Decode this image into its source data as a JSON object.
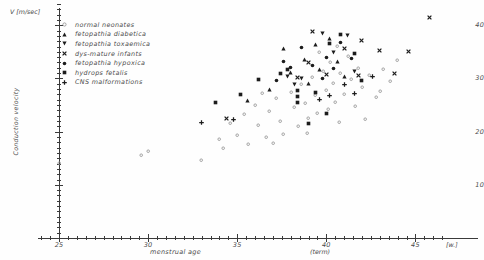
{
  "axes": {
    "y_unit": "V [m/sec]",
    "y_title": "Conduction velocity",
    "x_title": "menstrual age",
    "x_term_note": "(term)",
    "x_unit": "[w.]",
    "y_ticks": [
      "10",
      "20",
      "30",
      "40"
    ],
    "x_ticks": [
      "25",
      "30",
      "35",
      "40",
      "45"
    ]
  },
  "legend": {
    "items": [
      {
        "label": "normal neonates",
        "marker": "open-circle"
      },
      {
        "label": "fetopathia diabetica",
        "marker": "triangle-up"
      },
      {
        "label": "fetopathia toxaemica",
        "marker": "triangle-down"
      },
      {
        "label": "dys-mature infants",
        "marker": "cross-x"
      },
      {
        "label": "fetopathia hypoxica",
        "marker": "filled-circle"
      },
      {
        "label": "hydrops fetalis",
        "marker": "filled-square"
      },
      {
        "label": "CNS malformations",
        "marker": "plus"
      }
    ]
  },
  "chart_data": {
    "type": "scatter",
    "title": "",
    "xlabel": "menstrual age",
    "ylabel": "Conduction velocity",
    "xunit": "[w.]",
    "yunit": "V [m/sec]",
    "xlim": [
      23.8,
      46.8
    ],
    "ylim": [
      0,
      45
    ],
    "grid": false,
    "legend_position": "top-left",
    "series": [
      {
        "name": "normal neonates",
        "marker": "open-circle",
        "points": [
          [
            25.0,
            14.0
          ],
          [
            29.6,
            15.6
          ],
          [
            30.0,
            16.4
          ],
          [
            33.0,
            14.6
          ],
          [
            34.0,
            18.6
          ],
          [
            34.6,
            21.6
          ],
          [
            35.0,
            19.4
          ],
          [
            35.4,
            23.2
          ],
          [
            35.6,
            17.6
          ],
          [
            36.0,
            25.0
          ],
          [
            36.2,
            21.2
          ],
          [
            36.6,
            19.0
          ],
          [
            36.8,
            23.8
          ],
          [
            37.2,
            26.2
          ],
          [
            37.4,
            22.0
          ],
          [
            37.6,
            19.6
          ],
          [
            38.0,
            27.4
          ],
          [
            38.2,
            24.6
          ],
          [
            38.4,
            21.0
          ],
          [
            38.6,
            29.0
          ],
          [
            38.8,
            25.4
          ],
          [
            39.0,
            22.6
          ],
          [
            39.2,
            30.2
          ],
          [
            39.4,
            26.8
          ],
          [
            39.5,
            23.4
          ],
          [
            39.8,
            31.4
          ],
          [
            40.0,
            27.8
          ],
          [
            40.1,
            24.2
          ],
          [
            40.2,
            33.0
          ],
          [
            40.4,
            29.2
          ],
          [
            40.5,
            25.6
          ],
          [
            40.7,
            21.8
          ],
          [
            40.8,
            31.0
          ],
          [
            41.0,
            27.0
          ],
          [
            41.2,
            34.2
          ],
          [
            41.4,
            29.8
          ],
          [
            41.6,
            24.8
          ],
          [
            41.8,
            32.0
          ],
          [
            42.0,
            28.4
          ],
          [
            42.4,
            30.6
          ],
          [
            42.8,
            26.4
          ],
          [
            43.2,
            31.8
          ],
          [
            43.6,
            29.4
          ],
          [
            44.0,
            33.4
          ],
          [
            36.4,
            27.2
          ],
          [
            37.0,
            17.8
          ],
          [
            34.2,
            16.8
          ],
          [
            39.6,
            35.0
          ],
          [
            40.6,
            36.0
          ],
          [
            38.9,
            19.8
          ],
          [
            42.2,
            22.4
          ],
          [
            43.0,
            27.6
          ]
        ]
      },
      {
        "name": "fetopathia diabetica",
        "marker": "triangle-up",
        "points": [
          [
            35.6,
            25.8
          ],
          [
            37.6,
            35.6
          ],
          [
            38.0,
            31.2
          ],
          [
            38.8,
            33.6
          ],
          [
            39.0,
            29.0
          ],
          [
            39.4,
            36.4
          ],
          [
            39.6,
            31.6
          ],
          [
            40.2,
            37.6
          ],
          [
            40.6,
            33.2
          ],
          [
            36.8,
            28.0
          ],
          [
            41.0,
            30.4
          ]
        ]
      },
      {
        "name": "fetopathia toxaemica",
        "marker": "triangle-down",
        "points": [
          [
            37.8,
            30.4
          ],
          [
            38.6,
            30.0
          ],
          [
            39.8,
            38.4
          ],
          [
            40.4,
            34.8
          ],
          [
            41.2,
            38.0
          ],
          [
            38.2,
            28.8
          ],
          [
            41.6,
            31.4
          ]
        ]
      },
      {
        "name": "dys-mature infants",
        "marker": "cross-x",
        "points": [
          [
            34.4,
            22.4
          ],
          [
            38.4,
            30.2
          ],
          [
            39.2,
            38.8
          ],
          [
            40.0,
            30.8
          ],
          [
            41.0,
            35.6
          ],
          [
            41.8,
            30.6
          ],
          [
            43.0,
            35.2
          ],
          [
            43.8,
            31.0
          ],
          [
            44.6,
            35.0
          ],
          [
            45.8,
            41.4
          ],
          [
            42.0,
            37.2
          ],
          [
            39.0,
            33.0
          ]
        ]
      },
      {
        "name": "fetopathia hypoxica",
        "marker": "filled-circle",
        "points": [
          [
            37.6,
            33.2
          ],
          [
            38.0,
            32.0
          ],
          [
            38.6,
            35.8
          ],
          [
            39.2,
            32.4
          ],
          [
            39.8,
            30.0
          ],
          [
            40.0,
            34.0
          ],
          [
            40.4,
            31.8
          ],
          [
            41.4,
            33.8
          ],
          [
            37.2,
            29.6
          ],
          [
            40.8,
            36.8
          ]
        ]
      },
      {
        "name": "hydrops fetalis",
        "marker": "filled-square",
        "points": [
          [
            33.8,
            25.4
          ],
          [
            35.2,
            27.0
          ],
          [
            37.4,
            31.0
          ],
          [
            37.8,
            31.6
          ],
          [
            38.4,
            25.4
          ],
          [
            38.4,
            26.6
          ],
          [
            38.4,
            27.8
          ],
          [
            39.4,
            27.4
          ],
          [
            40.0,
            23.4
          ],
          [
            40.2,
            36.6
          ],
          [
            40.8,
            38.2
          ],
          [
            41.6,
            34.6
          ],
          [
            39.0,
            21.6
          ],
          [
            42.0,
            29.6
          ],
          [
            36.2,
            29.8
          ]
        ]
      },
      {
        "name": "CNS malformations",
        "marker": "plus",
        "points": [
          [
            34.8,
            22.2
          ],
          [
            39.6,
            26.0
          ],
          [
            41.0,
            28.8
          ],
          [
            41.6,
            27.2
          ],
          [
            42.6,
            30.4
          ],
          [
            33.0,
            21.8
          ],
          [
            40.2,
            26.8
          ]
        ]
      }
    ]
  }
}
